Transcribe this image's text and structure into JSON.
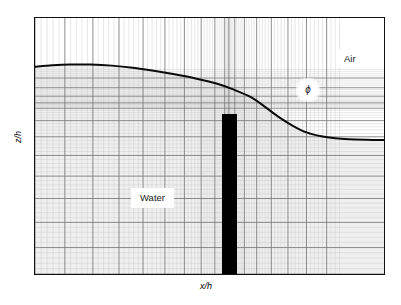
{
  "figure": {
    "title": "",
    "axes": {
      "x_label": "x/h",
      "y_label": "z/h"
    },
    "labels": {
      "air": "Air",
      "water": "Water",
      "phi": "ϕ"
    },
    "colors": {
      "frame": "#111111",
      "mesh_minor": "#c9c9c9",
      "mesh_major": "#6e6e6e",
      "interface": "#0b0b0b",
      "obstacle": "#000000",
      "water_fill": "#f0f0f0",
      "air_fill": "#ffffff"
    }
  },
  "chart_data": {
    "type": "line",
    "title": "",
    "xlabel": "x/h",
    "ylabel": "z/h",
    "grid": true,
    "legend_position": "none",
    "regions": [
      {
        "name": "Air",
        "position": "upper-right"
      },
      {
        "name": "Water",
        "position": "lower-left"
      }
    ],
    "annotations": [
      {
        "text": "ϕ",
        "x": 0.675,
        "y": 0.785,
        "note": "volume-fraction field marker at interface"
      }
    ],
    "series": [
      {
        "name": "free-surface interface",
        "x": [
          0.0,
          0.05,
          0.1,
          0.16,
          0.22,
          0.28,
          0.34,
          0.4,
          0.46,
          0.52,
          0.57,
          0.62,
          0.66,
          0.7,
          0.74,
          0.78,
          0.82,
          0.86,
          0.9,
          0.95,
          1.0
        ],
        "y": [
          0.81,
          0.815,
          0.818,
          0.818,
          0.814,
          0.806,
          0.794,
          0.78,
          0.764,
          0.744,
          0.72,
          0.69,
          0.652,
          0.612,
          0.578,
          0.552,
          0.538,
          0.53,
          0.526,
          0.524,
          0.523
        ]
      }
    ],
    "obstacle": {
      "name": "vertical plate",
      "x_left": 0.533,
      "x_right": 0.575,
      "y_bottom": 0.0,
      "y_top": 0.628
    },
    "mesh": {
      "description": "structured stretched grid, refined near the plate and near the free surface",
      "minor_cells_x": 88,
      "minor_cells_y": 64,
      "major_every_x": 5,
      "major_every_y": 5
    },
    "xlim": [
      0,
      1
    ],
    "ylim": [
      0,
      1
    ]
  }
}
